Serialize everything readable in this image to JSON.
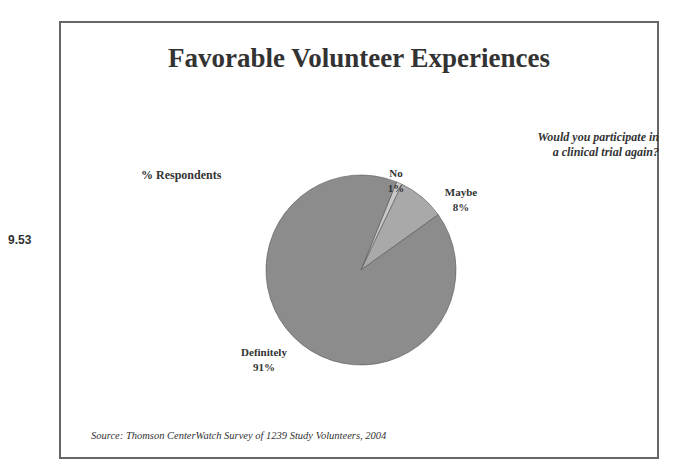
{
  "side_number": "9.53",
  "chart_data": {
    "type": "pie",
    "title": "Favorable Volunteer Experiences",
    "subtitle": "Would you participate in a clinical trial again?",
    "value_label": "% Respondents",
    "slices": [
      {
        "label": "Definitely",
        "value": 91,
        "display": "91%",
        "color": "#8c8c8c"
      },
      {
        "label": "Maybe",
        "value": 8,
        "display": "8%",
        "color": "#a9a9a9"
      },
      {
        "label": "No",
        "value": 1,
        "display": "1%",
        "color": "#c8c8c8"
      }
    ],
    "source": "Source: Thomson CenterWatch Survey of 1239 Study Volunteers, 2004"
  },
  "question_lines": [
    "Would you participate in",
    "a clinical trial again?"
  ]
}
